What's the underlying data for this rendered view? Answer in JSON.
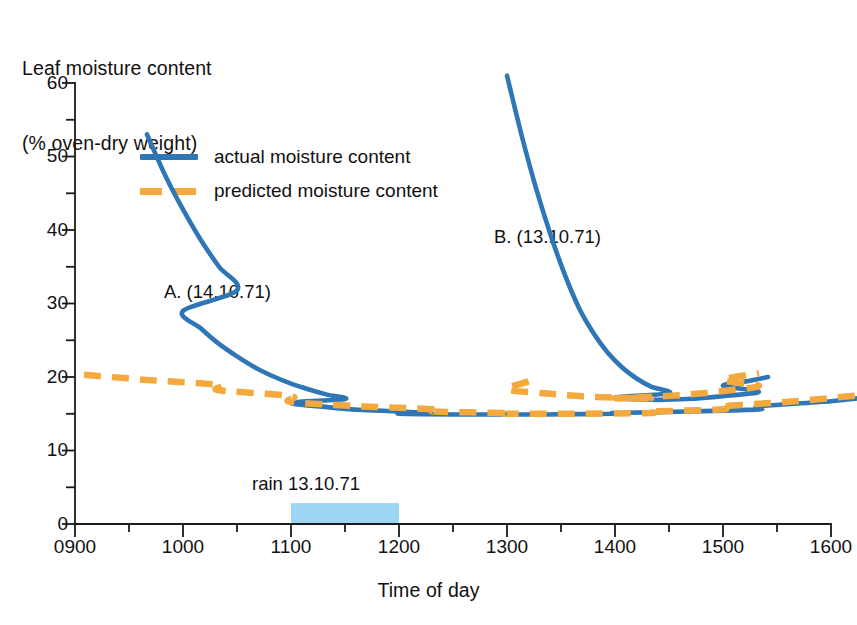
{
  "chart_data": {
    "type": "line",
    "title": "Leaf moisture content (% oven-dry weight)",
    "ylabel_line1": "Leaf moisture content",
    "ylabel_line2": "(% oven-dry weight)",
    "xlabel": "Time of day",
    "xlim": [
      900,
      1600
    ],
    "ylim": [
      0,
      60
    ],
    "yticks": [
      0,
      10,
      20,
      30,
      40,
      50,
      60
    ],
    "ytick_labels": [
      "0",
      "10",
      "20",
      "30",
      "40",
      "50",
      "60"
    ],
    "yminor_ticks": [
      5,
      15,
      25,
      35,
      45,
      55
    ],
    "xticks": [
      900,
      1000,
      1100,
      1200,
      1300,
      1400,
      1500,
      1600
    ],
    "xtick_labels": [
      "0900",
      "1000",
      "1100",
      "1200",
      "1300",
      "1400",
      "1500",
      "1600"
    ],
    "xminor_ticks": [
      930,
      1030,
      1130,
      1230,
      1330,
      1430,
      1530
    ],
    "grid": false,
    "legend_position": "upper-left-inside",
    "colors": {
      "actual": "#2E76B6",
      "predicted": "#F4A93C",
      "rain_band": "#9CD6F2",
      "axis": "#1a1a1a"
    },
    "legend": [
      {
        "label": "actual moisture content",
        "style": "solid",
        "color": "#2E76B6"
      },
      {
        "label": "predicted moisture content",
        "style": "dashed",
        "color": "#F4A93C"
      }
    ],
    "annotations": [
      {
        "name": "curve-a-label",
        "text": "A. (14.10.71)",
        "x": 1055,
        "y": 31
      },
      {
        "name": "curve-b-label",
        "text": "B. (13.10.71)",
        "x": 1288,
        "y": 38
      },
      {
        "name": "rain-band-label",
        "text": "rain 13.10.71",
        "x": 1135,
        "y": 7.5
      }
    ],
    "rain_band": {
      "label": "rain 13.10.71",
      "x_start": 1100,
      "x_end": 1200,
      "y_start": 0,
      "y_end": 2.85,
      "color": "#9CD6F2"
    },
    "series": [
      {
        "name": "A. (14.10.71) actual moisture content",
        "date": "14.10.71",
        "style": "solid",
        "color": "#2E76B6",
        "x": [
          940,
          950,
          960,
          970,
          980,
          990,
          1000,
          1010,
          1020,
          1030,
          1040,
          1050,
          1060,
          1070,
          1080,
          1090,
          1100,
          1120,
          1140,
          1170,
          1200,
          1240,
          1280,
          1320,
          1360,
          1400,
          1440,
          1480,
          1520,
          1560,
          1575
        ],
        "y": [
          53.0,
          47.5,
          42.8,
          38.6,
          35.0,
          31.8,
          29.0,
          26.6,
          24.5,
          22.8,
          21.3,
          20.1,
          19.1,
          18.3,
          17.6,
          17.0,
          16.5,
          15.9,
          15.5,
          15.2,
          15.0,
          14.9,
          14.9,
          14.9,
          15.0,
          15.1,
          15.3,
          15.6,
          16.0,
          16.7,
          17.1
        ]
      },
      {
        "name": "A. (14.10.71) predicted moisture content",
        "date": "14.10.71",
        "style": "dashed",
        "color": "#F4A93C",
        "x": [
          905,
          940,
          980,
          1020,
          1060,
          1100,
          1140,
          1180,
          1220,
          1260,
          1300,
          1340,
          1380,
          1420,
          1460,
          1500,
          1540,
          1575
        ],
        "y": [
          20.3,
          19.6,
          18.9,
          18.2,
          17.4,
          16.6,
          16.0,
          15.6,
          15.3,
          15.1,
          15.0,
          15.0,
          15.1,
          15.3,
          15.6,
          16.0,
          16.7,
          17.5
        ]
      },
      {
        "name": "B. (13.10.71) actual moisture content",
        "date": "13.10.71",
        "style": "solid",
        "color": "#2E76B6",
        "x": [
          1300,
          1308,
          1316,
          1324,
          1332,
          1340,
          1348,
          1356,
          1364,
          1372,
          1380,
          1390,
          1400,
          1420,
          1440,
          1460,
          1480,
          1500,
          1515,
          1525
        ],
        "y": [
          61.0,
          53.0,
          45.8,
          39.5,
          34.0,
          29.4,
          26.0,
          23.3,
          21.3,
          19.8,
          18.7,
          17.8,
          17.2,
          16.9,
          17.0,
          17.4,
          18.0,
          18.8,
          19.5,
          20.0
        ]
      },
      {
        "name": "B. (13.10.71) predicted moisture content",
        "date": "13.10.71",
        "style": "dashed",
        "color": "#F4A93C",
        "x": [
          1272,
          1300,
          1320,
          1340,
          1360,
          1380,
          1400,
          1420,
          1440,
          1460,
          1480,
          1500,
          1520
        ],
        "y": [
          19.4,
          18.3,
          17.8,
          17.4,
          17.2,
          17.1,
          17.1,
          17.3,
          17.6,
          18.1,
          18.8,
          19.6,
          20.5
        ]
      }
    ]
  },
  "legend": {
    "actual": "actual moisture content",
    "predicted": "predicted moisture content"
  },
  "labels": {
    "y_title_line1": "Leaf moisture content",
    "y_title_line2": "(% oven-dry weight)",
    "x_title": "Time of day",
    "annotation_a": "A. (14.10.71)",
    "annotation_b": "B. (13.10.71)",
    "rain": "rain 13.10.71"
  },
  "yticks": {
    "t0": "0",
    "t10": "10",
    "t20": "20",
    "t30": "30",
    "t40": "40",
    "t50": "50",
    "t60": "60"
  },
  "xticks": {
    "t0900": "0900",
    "t1000": "1000",
    "t1100": "1100",
    "t1200": "1200",
    "t1300": "1300",
    "t1400": "1400",
    "t1500": "1500",
    "t1600": "1600"
  }
}
